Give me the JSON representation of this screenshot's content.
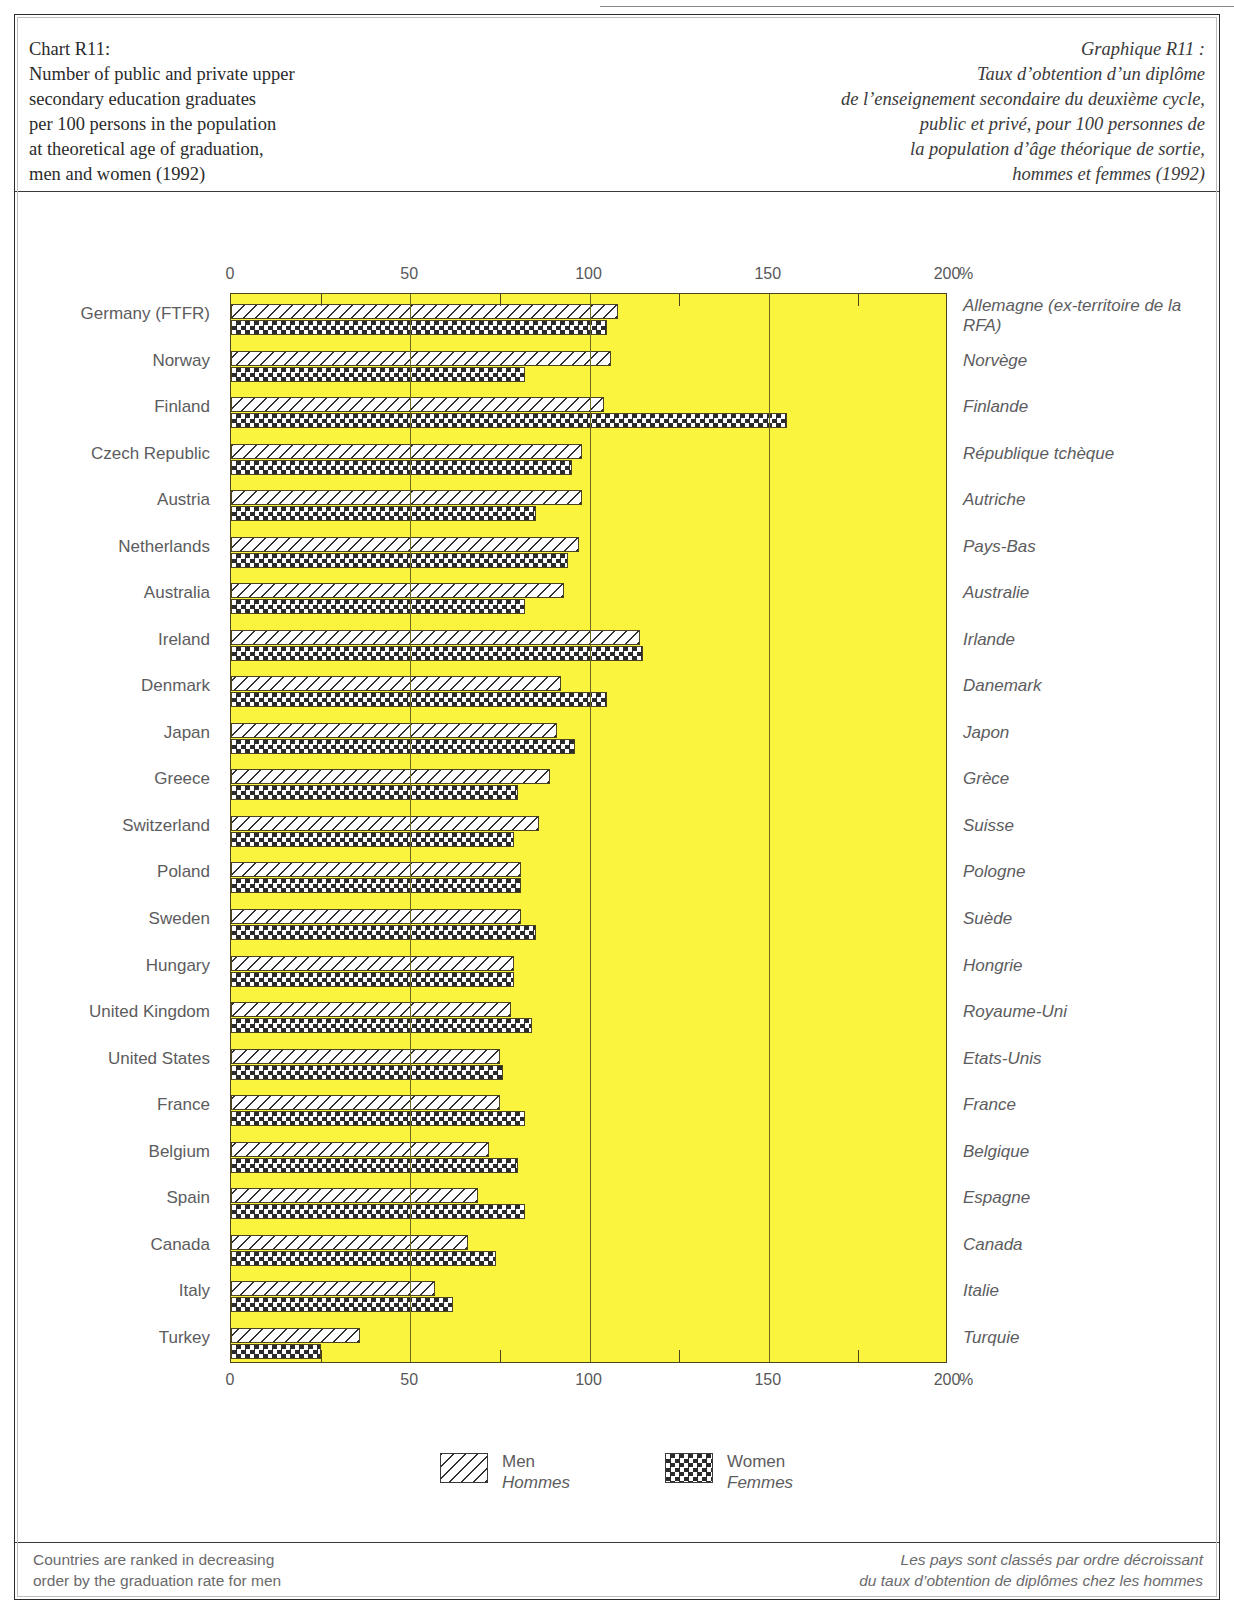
{
  "titles": {
    "en": "Chart R11:\nNumber of public and private upper\nsecondary education graduates\nper 100 persons in the population\nat theoretical age of graduation,\nmen and women (1992)",
    "fr": "Graphique R11 :\nTaux d’obtention d’un diplôme\nde l’enseignement secondaire du deuxième cycle,\npublic et privé, pour 100 personnes de\nla population d’âge théorique de sortie,\nhommes et femmes (1992)"
  },
  "legend": {
    "men_en": "Men",
    "men_fr": "Hommes",
    "women_en": "Women",
    "women_fr": "Femmes"
  },
  "footnotes": {
    "en": "Countries are ranked in decreasing\norder by the graduation rate for men",
    "fr": "Les pays sont classés par ordre décroissant\ndu taux d’obtention de diplômes chez les hommes"
  },
  "axis": {
    "unit": "%",
    "ticks": [
      0,
      50,
      100,
      150,
      200
    ],
    "tick_labels": [
      "0",
      "50",
      "100",
      "150",
      "200"
    ],
    "minor_step": 25
  },
  "colors": {
    "plot_background": "#fbf43f",
    "frame": "#2b2b2b",
    "gridline": "#6e6820",
    "label_text": "#5c5c5e",
    "title_text": "#2a2a2a"
  },
  "chart_data": {
    "type": "bar",
    "orientation": "horizontal",
    "title": "Number of public and private upper secondary education graduates per 100 persons in the population at theoretical age of graduation, men and women (1992)",
    "xlabel": "%",
    "ylabel": "",
    "xlim": [
      0,
      200
    ],
    "grid": true,
    "legend_position": "bottom",
    "categories": [
      "Germany (FTFR)",
      "Norway",
      "Finland",
      "Czech Republic",
      "Austria",
      "Netherlands",
      "Australia",
      "Ireland",
      "Denmark",
      "Japan",
      "Greece",
      "Switzerland",
      "Poland",
      "Sweden",
      "Hungary",
      "United Kingdom",
      "United States",
      "France",
      "Belgium",
      "Spain",
      "Canada",
      "Italy",
      "Turkey"
    ],
    "categories_fr": [
      "Allemagne (ex-territoire de la RFA)",
      "Norvège",
      "Finlande",
      "République tchèque",
      "Autriche",
      "Pays-Bas",
      "Australie",
      "Irlande",
      "Danemark",
      "Japon",
      "Grèce",
      "Suisse",
      "Pologne",
      "Suède",
      "Hongrie",
      "Royaume-Uni",
      "Etats-Unis",
      "France",
      "Belgique",
      "Espagne",
      "Canada",
      "Italie",
      "Turquie"
    ],
    "series": [
      {
        "name": "Men",
        "name_fr": "Hommes",
        "pattern": "diagonal-hatch",
        "values": [
          108,
          106,
          104,
          98,
          98,
          97,
          93,
          114,
          92,
          91,
          89,
          86,
          81,
          81,
          79,
          78,
          75,
          75,
          72,
          69,
          66,
          57,
          36
        ]
      },
      {
        "name": "Women",
        "name_fr": "Femmes",
        "pattern": "checkerboard",
        "values": [
          105,
          82,
          155,
          95,
          85,
          94,
          82,
          115,
          105,
          96,
          80,
          79,
          81,
          85,
          79,
          84,
          76,
          82,
          80,
          82,
          74,
          62,
          25
        ]
      }
    ]
  }
}
